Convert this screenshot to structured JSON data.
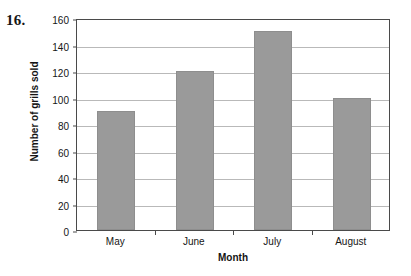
{
  "question_number": "16.",
  "chart_data": {
    "type": "bar",
    "title": "",
    "categories": [
      "May",
      "June",
      "July",
      "August"
    ],
    "values": [
      90,
      120,
      150,
      100
    ],
    "series": [
      {
        "name": "Number of grills sold",
        "values": [
          90,
          120,
          150,
          100
        ]
      }
    ],
    "xlabel": "Month",
    "ylabel": "Number of grills sold",
    "ylim": [
      0,
      160
    ],
    "ytick_step": 20,
    "yticks": [
      0,
      20,
      40,
      60,
      80,
      100,
      120,
      140,
      160
    ],
    "ytick_labels": [
      "0",
      "20",
      "40",
      "60",
      "80",
      "100",
      "120",
      "140",
      "160"
    ],
    "grid": true,
    "grid_axis": "y",
    "legend": false,
    "legend_position": "none",
    "bar_color": "#9a9a9a",
    "gridline_color": "#b9b9b9",
    "axis_color": "#4a4a4a",
    "background_color": "#ffffff"
  }
}
